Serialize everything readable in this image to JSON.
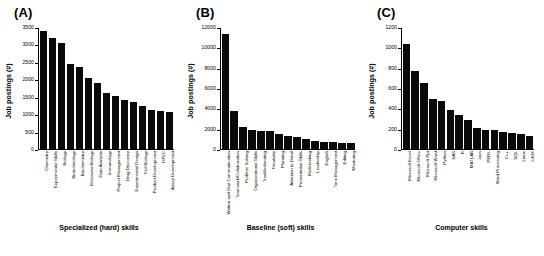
{
  "figure": {
    "panels": [
      {
        "letter": "(A)",
        "ylabel": "Job postings (#)",
        "xlabel": "Specialized (hard) skills"
      },
      {
        "letter": "(B)",
        "ylabel": "Job postings (#)",
        "xlabel": "Baseline (soft) skills"
      },
      {
        "letter": "(C)",
        "ylabel": "Job postings (#)",
        "xlabel": "Computer skills"
      }
    ]
  },
  "chart_data": [
    {
      "type": "bar",
      "title": "(A)",
      "xlabel": "Specialized (hard) skills",
      "ylabel": "Job postings (#)",
      "ylim": [
        0,
        3500
      ],
      "yticks": [
        0,
        500,
        1000,
        1500,
        2000,
        2500,
        3000,
        3500
      ],
      "ytick_labels": [
        "0",
        "500",
        "1000",
        "1500",
        "2000",
        "2500",
        "3000",
        "3500"
      ],
      "grid": false,
      "legend": "none",
      "categories": [
        "Chemistry",
        "Experimental Skills",
        "Biology",
        "Biotechnology",
        "Biochemistry",
        "Molecular Biology",
        "Data Analysis",
        "Immunology",
        "Project Management",
        "Drug Discovery",
        "Experimental Design",
        "Cell Biology",
        "Product Development",
        "HPLC",
        "Assay Development"
      ],
      "values": [
        3410,
        3210,
        3070,
        2460,
        2370,
        2050,
        1910,
        1620,
        1540,
        1430,
        1350,
        1250,
        1120,
        1100,
        1080
      ]
    },
    {
      "type": "bar",
      "title": "(B)",
      "xlabel": "Baseline (soft) skills",
      "ylabel": "Job postings (#)",
      "ylim": [
        0,
        12000
      ],
      "yticks": [
        0,
        2000,
        4000,
        6000,
        8000,
        10000,
        12000
      ],
      "ytick_labels": [
        "0",
        "2000",
        "4000",
        "6000",
        "8000",
        "10000",
        "12000"
      ],
      "grid": false,
      "legend": "none",
      "categories": [
        "Written and Oral Communication",
        "Teamwork/Collaboration",
        "Problem Solving",
        "Organizational Skills",
        "Troubleshooting",
        "Creativity",
        "Planning",
        "Attention to Detail",
        "Presentation Skills",
        "Multi-tasking",
        "Leadership",
        "English",
        "Time Management",
        "Editing",
        "Mentoring"
      ],
      "values": [
        11400,
        3750,
        2150,
        1870,
        1820,
        1740,
        1500,
        1250,
        1180,
        1010,
        830,
        680,
        670,
        620,
        600
      ]
    },
    {
      "type": "bar",
      "title": "(C)",
      "xlabel": "Computer skills",
      "ylabel": "Job postings (#)",
      "ylim": [
        0,
        1200
      ],
      "yticks": [
        0,
        200,
        400,
        600,
        800,
        1000,
        1200
      ],
      "ytick_labels": [
        "0",
        "200",
        "400",
        "600",
        "800",
        "1000",
        "1200"
      ],
      "grid": false,
      "legend": "none",
      "categories": [
        "Microsoft Excel",
        "Microsoft Office",
        "Microsoft Ppt",
        "Microsoft Word",
        "Python",
        "SAS",
        "R",
        "MATLAB",
        "Java",
        "PERL",
        "Word Processing",
        "C++",
        "SQL",
        "Linux",
        "UNIX"
      ],
      "values": [
        1040,
        775,
        650,
        500,
        480,
        385,
        335,
        285,
        205,
        190,
        185,
        165,
        160,
        150,
        130
      ]
    }
  ]
}
